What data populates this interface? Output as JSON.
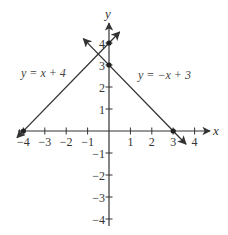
{
  "chart_data": {
    "type": "line",
    "title": "",
    "xlabel": "x",
    "ylabel": "y",
    "xlim": [
      -4,
      4
    ],
    "ylim": [
      -4,
      4
    ],
    "grid": false,
    "x_ticks": [
      -4,
      -3,
      -2,
      -1,
      1,
      2,
      3,
      4
    ],
    "x_tick_labels": [
      "−4",
      "−3",
      "−2",
      "−1",
      "1",
      "2",
      "3",
      "4"
    ],
    "y_ticks": [
      4,
      3,
      2,
      1,
      -1,
      -2,
      -3,
      -4
    ],
    "y_tick_labels": [
      "4",
      "3",
      "2",
      "1",
      "−1",
      "−2",
      "−3",
      "−4"
    ],
    "series": [
      {
        "name": "y = x + 4",
        "label": "y = x + 4",
        "slope": 1,
        "intercept": 4,
        "x": [
          -4.3,
          0.5
        ],
        "y": [
          -0.3,
          4.5
        ],
        "marked_points": [
          [
            -4,
            0
          ],
          [
            0,
            4
          ]
        ]
      },
      {
        "name": "y = −x + 3",
        "label": "y = −x + 3",
        "slope": -1,
        "intercept": 3,
        "x": [
          -1.2,
          3.6
        ],
        "y": [
          4.2,
          -0.6
        ],
        "marked_points": [
          [
            0,
            3
          ],
          [
            3,
            0
          ]
        ]
      }
    ],
    "colors": {
      "axis": "#333333",
      "line": "#333333"
    }
  },
  "labels": {
    "x_axis": "x",
    "y_axis": "y",
    "eq1": "y = x + 4",
    "eq2": "y = −x + 3"
  }
}
